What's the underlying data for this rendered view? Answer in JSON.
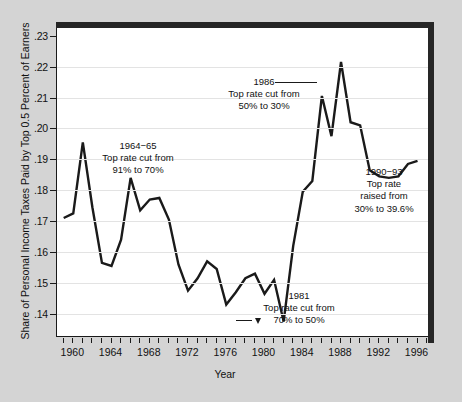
{
  "chart_data": {
    "type": "line",
    "title": "",
    "xlabel": "Year",
    "ylabel": "Share of Personal Income Taxes Paid by Top 0.5 Percent of Earners",
    "xlim": [
      1958.3,
      1997.2
    ],
    "ylim": [
      0.1325,
      0.2325
    ],
    "grid": true,
    "legend": "none",
    "ytick_labels": [
      ".23",
      ".22",
      ".21",
      ".20",
      ".19",
      ".18",
      ".17",
      ".16",
      ".15",
      ".14"
    ],
    "ytick_values": [
      0.23,
      0.22,
      0.21,
      0.2,
      0.19,
      0.18,
      0.17,
      0.16,
      0.15,
      0.14
    ],
    "xtick_labels": [
      "1960",
      "1964",
      "1968",
      "1972",
      "1976",
      "1980",
      "1984",
      "1988",
      "1992",
      "1996"
    ],
    "xtick_values": [
      1960,
      1964,
      1968,
      1972,
      1976,
      1980,
      1984,
      1988,
      1992,
      1996
    ],
    "xtick_minor_start": 1959,
    "xtick_minor_end": 1997,
    "series": [
      {
        "name": "Share of personal income taxes paid by top 0.5 percent of earners",
        "x": [
          1959,
          1960,
          1961,
          1962,
          1963,
          1964,
          1965,
          1966,
          1967,
          1968,
          1969,
          1970,
          1971,
          1972,
          1973,
          1974,
          1975,
          1976,
          1977,
          1978,
          1979,
          1980,
          1981,
          1982,
          1983,
          1984,
          1985,
          1986,
          1987,
          1988,
          1989,
          1990,
          1991,
          1992,
          1993,
          1994,
          1995,
          1996
        ],
        "values": [
          0.171,
          0.1725,
          0.1955,
          0.1745,
          0.1565,
          0.1555,
          0.164,
          0.184,
          0.1735,
          0.177,
          0.1775,
          0.1705,
          0.156,
          0.1475,
          0.1515,
          0.157,
          0.1545,
          0.143,
          0.147,
          0.1515,
          0.153,
          0.1465,
          0.151,
          0.1375,
          0.162,
          0.1795,
          0.183,
          0.2105,
          0.1975,
          0.2215,
          0.202,
          0.201,
          0.1865,
          0.1845,
          0.184,
          0.1845,
          0.1885,
          0.1895
        ]
      }
    ],
    "annotations": [
      {
        "id": "1964-65",
        "lines": [
          "1964−65",
          "Top rate cut from",
          "91% to 70%"
        ],
        "note": "Top rate cut from 91% to 70%"
      },
      {
        "id": "1986",
        "lines": [
          "1986",
          "Top rate cut from",
          "50% to 30%"
        ],
        "note": "Top rate cut from 50% to 30%",
        "has_leader_line": true
      },
      {
        "id": "1990-93",
        "lines": [
          "1990−93",
          "Top rate",
          "raised from",
          "30% to 39.6%"
        ],
        "note": "Top rate raised from 30% to 39.6%"
      },
      {
        "id": "1981",
        "lines": [
          "1981",
          "Top rate cut from",
          "70% to 50%"
        ],
        "note": "Top rate cut from 70% to 50%",
        "has_leader_line": true,
        "has_pointer": true
      }
    ],
    "colors": {
      "line": "#1a1a1a",
      "plot_background": "#ffffff",
      "figure_background": "#d4d4d4",
      "gridline": "#e3e3e3",
      "frame": "#262626",
      "text": "#111111"
    }
  },
  "annot_1964": {
    "l1": "1964−65",
    "l2": "Top rate cut from",
    "l3": "91% to 70%"
  },
  "annot_1986": {
    "l1": "1986",
    "l2": "Top rate cut from",
    "l3": "50% to 30%"
  },
  "annot_1990": {
    "l1": "1990−93",
    "l2": "Top rate",
    "l3": "raised from",
    "l4": "30% to 39.6%"
  },
  "annot_1981": {
    "l1": "1981",
    "l2": "Top rate cut from",
    "l3": "70% to 50%"
  },
  "axes": {
    "x_title": "Year",
    "y_title": "Share of Personal Income Taxes Paid by Top 0.5 Percent of Earners"
  }
}
